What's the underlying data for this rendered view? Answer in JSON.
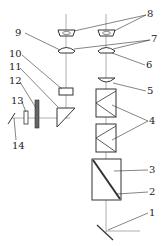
{
  "diagram": {
    "type": "optical system schematic",
    "labels": {
      "l1": "1",
      "l2": "2",
      "l3": "3",
      "l4": "4",
      "l5": "5",
      "l6": "6",
      "l7": "7",
      "l8": "8",
      "l9": "9",
      "l10": "10",
      "l11": "11",
      "l12": "12",
      "l13": "13",
      "l14": "14"
    },
    "colors": {
      "line": "#333333",
      "axis": "#999999",
      "background": "#ffffff"
    }
  }
}
